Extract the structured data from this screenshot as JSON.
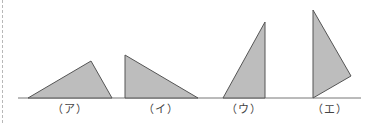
{
  "figure": {
    "fill_color": "#bdbdbd",
    "stroke_color": "#555555",
    "baseline": {
      "x1": 18,
      "x2": 361,
      "y": 98
    },
    "triangles": [
      {
        "label": "（ア）",
        "label_x": 70,
        "points": "28,98 91,61 112,98"
      },
      {
        "label": "（イ）",
        "label_x": 161,
        "points": "125,55 125,98 198,98"
      },
      {
        "label": "（ウ）",
        "label_x": 244,
        "points": "223,98 265,22 265,98"
      },
      {
        "label": "（エ）",
        "label_x": 330,
        "points": "313,10 351,76 313,98"
      }
    ]
  }
}
